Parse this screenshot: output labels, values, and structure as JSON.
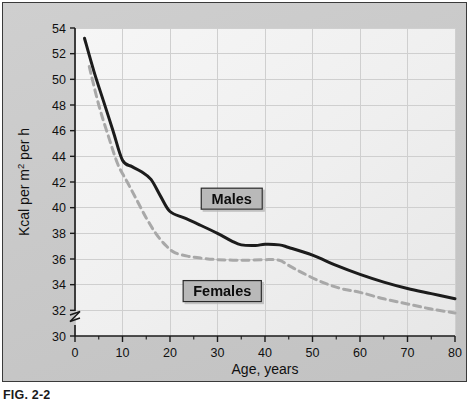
{
  "figure": {
    "caption": "FIG. 2-2",
    "panel_bg": "#c9c9c9",
    "plot_bg": "#f2f2f2",
    "border_color": "#3a3a3a"
  },
  "labels": {
    "males": "Males",
    "females": "Females",
    "x_axis_title": "Age, years",
    "y_axis_title_prefix": "Kcal per m",
    "y_axis_title_sup": "2",
    "y_axis_title_suffix": " per h",
    "y_axis_title_full": "Kcal per m² per h"
  },
  "chart_data": {
    "type": "line",
    "title": "",
    "subtitle": "",
    "xlabel": "Age, years",
    "ylabel": "Kcal per m² per h",
    "xlim": [
      0,
      80
    ],
    "ylim": [
      30,
      54
    ],
    "y_axis_break": true,
    "y_axis_break_below": 30,
    "grid": true,
    "grid_x_step": 10,
    "grid_y_step": 2,
    "legend_position": "inline-annotation",
    "xticks": [
      0,
      10,
      20,
      30,
      40,
      50,
      60,
      70,
      80
    ],
    "xtick_labels": [
      "0",
      "10",
      "20",
      "30",
      "40",
      "50",
      "60",
      "70",
      "80"
    ],
    "x_minor_tick_step": 5,
    "yticks": [
      30,
      32,
      34,
      36,
      38,
      40,
      42,
      44,
      46,
      48,
      50,
      52,
      54
    ],
    "ytick_labels": [
      "30",
      "32",
      "34",
      "36",
      "38",
      "40",
      "42",
      "44",
      "46",
      "48",
      "50",
      "52",
      "54"
    ],
    "series": [
      {
        "name": "Males",
        "style": "solid",
        "color": "#1c1c1c",
        "width": 3.0,
        "points": [
          [
            2,
            53.2
          ],
          [
            4,
            50.6
          ],
          [
            6,
            48.3
          ],
          [
            8,
            46.0
          ],
          [
            10,
            43.7
          ],
          [
            12,
            43.2
          ],
          [
            14,
            42.8
          ],
          [
            16,
            42.2
          ],
          [
            18,
            40.9
          ],
          [
            20,
            39.7
          ],
          [
            23,
            39.2
          ],
          [
            26,
            38.7
          ],
          [
            30,
            38.0
          ],
          [
            33,
            37.4
          ],
          [
            35,
            37.1
          ],
          [
            38,
            37.05
          ],
          [
            40,
            37.15
          ],
          [
            43,
            37.1
          ],
          [
            45,
            36.9
          ],
          [
            50,
            36.3
          ],
          [
            55,
            35.5
          ],
          [
            60,
            34.8
          ],
          [
            65,
            34.2
          ],
          [
            70,
            33.7
          ],
          [
            75,
            33.3
          ],
          [
            80,
            32.9
          ]
        ]
      },
      {
        "name": "Females",
        "style": "dashed",
        "color": "#a8a8a8",
        "width": 3.0,
        "dash": "7,5",
        "points": [
          [
            3,
            51.0
          ],
          [
            5,
            48.0
          ],
          [
            7,
            45.6
          ],
          [
            9,
            43.4
          ],
          [
            11,
            42.0
          ],
          [
            13,
            40.6
          ],
          [
            15,
            39.2
          ],
          [
            17,
            38.0
          ],
          [
            19,
            37.1
          ],
          [
            21,
            36.5
          ],
          [
            24,
            36.2
          ],
          [
            27,
            36.05
          ],
          [
            30,
            35.95
          ],
          [
            35,
            35.9
          ],
          [
            40,
            35.95
          ],
          [
            43,
            35.9
          ],
          [
            45,
            35.5
          ],
          [
            48,
            34.9
          ],
          [
            52,
            34.2
          ],
          [
            56,
            33.7
          ],
          [
            60,
            33.4
          ],
          [
            65,
            32.9
          ],
          [
            70,
            32.5
          ],
          [
            75,
            32.1
          ],
          [
            80,
            31.8
          ]
        ]
      }
    ],
    "annotations": [
      {
        "text": "Males",
        "x": 33,
        "y": 40.7
      },
      {
        "text": "Females",
        "x": 31,
        "y": 33.5
      }
    ]
  }
}
